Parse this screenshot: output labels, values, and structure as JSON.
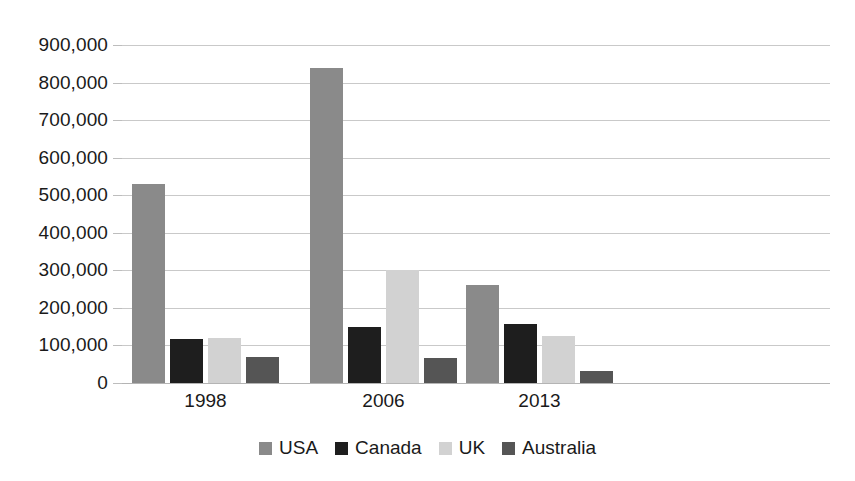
{
  "chart_data": {
    "type": "bar",
    "title": "",
    "subtitle": "",
    "xlabel": "",
    "ylabel": "",
    "categories": [
      "1998",
      "2006",
      "2013"
    ],
    "series": [
      {
        "name": "USA",
        "color": "#8a8a8a",
        "values": [
          530000,
          838000,
          262000
        ]
      },
      {
        "name": "Canada",
        "color": "#1e1e1e",
        "values": [
          118000,
          150000,
          158000
        ]
      },
      {
        "name": "UK",
        "color": "#d2d2d2",
        "values": [
          120000,
          300000,
          124000
        ]
      },
      {
        "name": "Australia",
        "color": "#555555",
        "values": [
          70000,
          67000,
          32000
        ]
      }
    ],
    "ylim": [
      0,
      900000
    ],
    "ytick_step": 100000,
    "ytick_labels": [
      "900,000",
      "800,000",
      "700,000",
      "600,000",
      "500,000",
      "400,000",
      "300,000",
      "200,000",
      "100,000",
      "0"
    ],
    "ytick_values": [
      900000,
      800000,
      700000,
      600000,
      500000,
      400000,
      300000,
      200000,
      100000,
      0
    ],
    "grid": true,
    "grid_axis": "y",
    "legend_position": "bottom",
    "legend_entries": [
      "USA",
      "Canada",
      "UK",
      "Australia"
    ],
    "annotations": [],
    "background_color": "#ffffff",
    "gridline_color": "#c9c9c9"
  }
}
